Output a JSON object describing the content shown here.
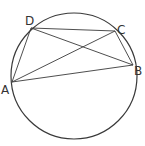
{
  "diagram": {
    "type": "cyclic-quadrilateral",
    "colors": {
      "stroke": "#3a3a3a",
      "label": "#333333",
      "background": "#ffffff"
    },
    "circle": {
      "cx": 74,
      "cy": 76,
      "r": 63
    },
    "points": [
      {
        "id": "A",
        "label": "A",
        "x": 12,
        "y": 82,
        "label_x": 1,
        "label_y": 94
      },
      {
        "id": "B",
        "label": "B",
        "x": 133,
        "y": 65,
        "label_x": 134,
        "label_y": 75
      },
      {
        "id": "C",
        "label": "C",
        "x": 115,
        "y": 31,
        "label_x": 117,
        "label_y": 34
      },
      {
        "id": "D",
        "label": "D",
        "x": 31,
        "y": 28,
        "label_x": 25,
        "label_y": 25
      }
    ],
    "segments": [
      {
        "from": "A",
        "to": "B"
      },
      {
        "from": "B",
        "to": "C"
      },
      {
        "from": "C",
        "to": "D"
      },
      {
        "from": "D",
        "to": "A"
      },
      {
        "from": "A",
        "to": "C"
      },
      {
        "from": "D",
        "to": "B"
      }
    ]
  }
}
